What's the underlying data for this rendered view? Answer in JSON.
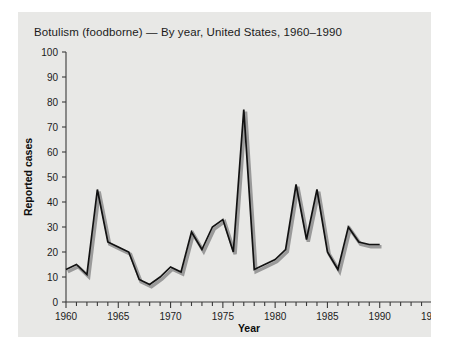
{
  "figure": {
    "title": "Botulism (foodborne) — By year, United States, 1960–1990",
    "background_color": "#e8e8e6",
    "line_color": "#111111",
    "shadow_color": "#9a9a9a"
  },
  "chart_data": {
    "type": "line",
    "title": "Botulism (foodborne) — By year, United States, 1960–1990",
    "xlabel": "Year",
    "ylabel": "Reported cases",
    "xlim": [
      1960,
      1995
    ],
    "ylim": [
      0,
      100
    ],
    "xticks": [
      1960,
      1965,
      1970,
      1975,
      1980,
      1985,
      1990,
      1995
    ],
    "xtick_labels": [
      "1960",
      "1965",
      "1970",
      "1975",
      "1980",
      "1985",
      "1990",
      "1995"
    ],
    "xminor_tick_interval": 1,
    "yticks": [
      0,
      10,
      20,
      30,
      40,
      50,
      60,
      70,
      80,
      90,
      100
    ],
    "ytick_labels": [
      "0",
      "10",
      "20",
      "30",
      "40",
      "50",
      "60",
      "70",
      "80",
      "90",
      "100"
    ],
    "grid": false,
    "legend": false,
    "x": [
      1960,
      1961,
      1962,
      1963,
      1964,
      1965,
      1966,
      1967,
      1968,
      1969,
      1970,
      1971,
      1972,
      1973,
      1974,
      1975,
      1976,
      1977,
      1978,
      1979,
      1980,
      1981,
      1982,
      1983,
      1984,
      1985,
      1986,
      1987,
      1988,
      1989,
      1990
    ],
    "series": [
      {
        "name": "Reported cases",
        "values": [
          13,
          15,
          11,
          45,
          24,
          22,
          20,
          9,
          7,
          10,
          14,
          12,
          28,
          21,
          30,
          33,
          20,
          77,
          13,
          15,
          17,
          21,
          47,
          25,
          45,
          20,
          13,
          30,
          24,
          23,
          23
        ]
      }
    ]
  },
  "axis": {
    "year_label": "Year",
    "cases_label": "Reported cases"
  }
}
